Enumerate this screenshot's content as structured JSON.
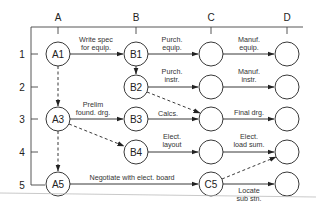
{
  "diagram": {
    "columns": [
      "A",
      "B",
      "C",
      "D"
    ],
    "rows": [
      "1",
      "2",
      "3",
      "4",
      "5"
    ],
    "nodes": {
      "A1": "A1",
      "B1": "B1",
      "B2": "B2",
      "A3": "A3",
      "B3": "B3",
      "B4": "B4",
      "A5": "A5",
      "C5": "C5"
    },
    "edges": {
      "a1_b1": [
        "Write spec",
        "for equip."
      ],
      "b1_c1": [
        "Purch.",
        "equip."
      ],
      "c1_d1": [
        "Manuf.",
        "equip."
      ],
      "b2_c2": [
        "Purch.",
        "instr."
      ],
      "c2_d2": [
        "Manuf.",
        "instr."
      ],
      "a3_b3": [
        "Prelim",
        "found. drg."
      ],
      "b3_c3": [
        "Calcs."
      ],
      "c3_d3": [
        "Final drg."
      ],
      "b4_c4": [
        "Elect.",
        "layout"
      ],
      "c4_d4": [
        "Elect.",
        "load sum."
      ],
      "a5_c5": [
        "Negotiate with elect. board"
      ],
      "c5_d5": [
        "Locate",
        "sub stn."
      ]
    }
  }
}
